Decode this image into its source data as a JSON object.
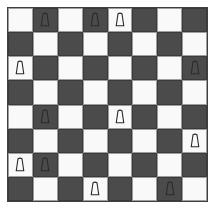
{
  "title": "Chessboard diagram",
  "board": {
    "rows": 8,
    "columns": 8,
    "light_square_color": "#f9f9f9",
    "dark_square_color": "#4b4b4b",
    "border_color": "#3f3f3f",
    "piece_outline_color": "#2b2b2b",
    "background_color": "#ffffff",
    "orientation": "white-bottom",
    "piece_glyph": "pawn-trapezoid",
    "piece_count": 12,
    "occupancy": [
      [
        0,
        1,
        0,
        1,
        1,
        0,
        0,
        0
      ],
      [
        0,
        0,
        0,
        0,
        0,
        0,
        0,
        0
      ],
      [
        1,
        0,
        0,
        0,
        0,
        0,
        0,
        1
      ],
      [
        0,
        0,
        0,
        0,
        0,
        0,
        0,
        0
      ],
      [
        0,
        1,
        0,
        0,
        1,
        0,
        0,
        0
      ],
      [
        0,
        0,
        0,
        0,
        0,
        0,
        0,
        1
      ],
      [
        1,
        1,
        0,
        0,
        0,
        0,
        0,
        0
      ],
      [
        0,
        0,
        0,
        1,
        0,
        0,
        1,
        0
      ]
    ],
    "pieces": [
      {
        "row": 1,
        "col": 2,
        "square": "b8",
        "square_shade": "dark",
        "type": "pawn"
      },
      {
        "row": 1,
        "col": 4,
        "square": "d8",
        "square_shade": "dark",
        "type": "pawn"
      },
      {
        "row": 1,
        "col": 5,
        "square": "e8",
        "square_shade": "light",
        "type": "pawn"
      },
      {
        "row": 3,
        "col": 1,
        "square": "a6",
        "square_shade": "light",
        "type": "pawn"
      },
      {
        "row": 3,
        "col": 8,
        "square": "h6",
        "square_shade": "dark",
        "type": "pawn"
      },
      {
        "row": 5,
        "col": 2,
        "square": "b4",
        "square_shade": "dark",
        "type": "pawn"
      },
      {
        "row": 5,
        "col": 5,
        "square": "e4",
        "square_shade": "light",
        "type": "pawn"
      },
      {
        "row": 6,
        "col": 8,
        "square": "h3",
        "square_shade": "light",
        "type": "pawn"
      },
      {
        "row": 7,
        "col": 1,
        "square": "a2",
        "square_shade": "light",
        "type": "pawn"
      },
      {
        "row": 7,
        "col": 2,
        "square": "b2",
        "square_shade": "dark",
        "type": "pawn"
      },
      {
        "row": 8,
        "col": 4,
        "square": "d1",
        "square_shade": "light",
        "type": "pawn"
      },
      {
        "row": 8,
        "col": 7,
        "square": "g1",
        "square_shade": "dark",
        "type": "pawn"
      }
    ]
  }
}
